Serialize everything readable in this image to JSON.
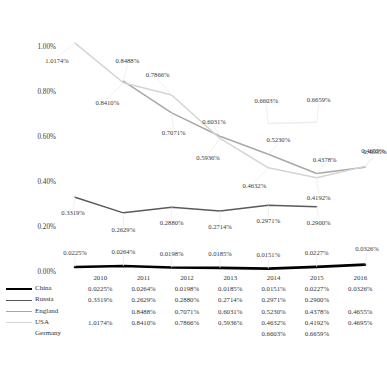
{
  "chart_data": {
    "type": "line",
    "title": "",
    "xlabel": "",
    "ylabel": "",
    "categories": [
      "2010",
      "2011",
      "2012",
      "2013",
      "2014",
      "2015",
      "2016"
    ],
    "ylim": [
      0,
      1.1
    ],
    "ytick_labels": [
      "0.00%",
      "0.20%",
      "0.40%",
      "0.60%",
      "0.80%",
      "1.00%"
    ],
    "ytick_values": [
      0,
      0.2,
      0.4,
      0.6,
      0.8,
      1.0
    ],
    "grid": false,
    "legend_position": "left-table",
    "value_suffix": "%",
    "series": [
      {
        "name": "China",
        "color": "#000000",
        "width": 2.6,
        "values": [
          0.0225,
          0.0264,
          0.0198,
          0.0185,
          0.0151,
          0.0227,
          0.0326
        ],
        "labels": [
          "0.0225%",
          "0.0264%",
          "0.0198%",
          "0.0185%",
          "0.0151%",
          "0.0227%",
          "0.0326%"
        ]
      },
      {
        "name": "Russia",
        "color": "#5a5a5a",
        "width": 1.5,
        "values": [
          0.3319,
          0.2629,
          0.288,
          0.2714,
          0.2971,
          0.29,
          null
        ],
        "labels": [
          "0.3319%",
          "0.2629%",
          "0.2880%",
          "0.2714%",
          "0.2971%",
          "0.2900%",
          ""
        ]
      },
      {
        "name": "England",
        "color": "#a8a8a8",
        "width": 1.5,
        "values": [
          null,
          0.8488,
          0.7071,
          0.6031,
          0.523,
          0.4378,
          0.4655
        ],
        "labels": [
          "",
          "0.8488%",
          "0.7071%",
          "0.6031%",
          "0.5230%",
          "0.4378%",
          "0.4655%"
        ]
      },
      {
        "name": "USA",
        "color": "#d4d4d4",
        "width": 1.5,
        "values": [
          1.0174,
          0.841,
          0.7866,
          0.5936,
          0.4632,
          0.4192,
          0.4695
        ],
        "labels": [
          "1.0174%",
          "0.8410%",
          "0.7866%",
          "0.5936%",
          "0.4632%",
          "0.4192%",
          "0.4695%"
        ]
      },
      {
        "name": "Germany",
        "color": "#ededed",
        "width": 1.5,
        "values": [
          null,
          null,
          null,
          null,
          0.6603,
          0.6659,
          null
        ],
        "labels": [
          "",
          "",
          "",
          "",
          "0.6603%",
          "0.6659%",
          ""
        ]
      }
    ]
  },
  "table": {
    "year_header": [
      "2010",
      "2011",
      "2012",
      "2013",
      "2014",
      "2015",
      "2016"
    ],
    "rows": [
      {
        "series": "China",
        "swatch": "sw-china",
        "cells": [
          "0.0225%",
          "0.0264%",
          "0.0198%",
          "0.0185%",
          "0.0151%",
          "0.0227%",
          "0.0326%"
        ]
      },
      {
        "series": "Russia",
        "swatch": "sw-russia",
        "cells": [
          "0.3319%",
          "0.2629%",
          "0.2880%",
          "0.2714%",
          "0.2971%",
          "0.2900%",
          ""
        ]
      },
      {
        "series": "England",
        "swatch": "sw-england",
        "cells": [
          "",
          "0.8488%",
          "0.7071%",
          "0.6031%",
          "0.5230%",
          "0.4378%",
          "0.4655%"
        ]
      },
      {
        "series": "USA",
        "swatch": "sw-usa",
        "cells": [
          "1.0174%",
          "0.8410%",
          "0.7866%",
          "0.5936%",
          "0.4632%",
          "0.4192%",
          "0.4695%"
        ]
      },
      {
        "series": "Germany",
        "swatch": "sw-germany",
        "cells": [
          "",
          "",
          "",
          "",
          "0.6603%",
          "0.6659%",
          ""
        ]
      }
    ]
  },
  "footnote": {
    "text": ""
  }
}
